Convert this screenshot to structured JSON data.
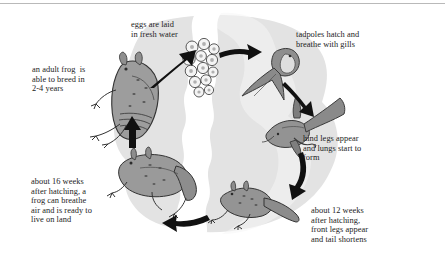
{
  "figure": {
    "background_color": "#ffffff",
    "blob_color": "#e3e3e3",
    "water_color": "#ffffff",
    "ink_color": "#1b1b1b",
    "rule_color": "#b9b9b9",
    "frog_fill": "#9a9a9a",
    "frog_shade": "#6d6d6d",
    "egg_fill": "#f2f2f2"
  },
  "labels": {
    "eggs": "eggs are laid\nin fresh water",
    "tadpoles": "tadpoles hatch and\nbreathe with gills",
    "adult": "an adult frog  is\nable to breed in\n2-4 years",
    "hind_legs": "hind legs appear\nand lungs start to\nform",
    "sixteen_weeks": "about 16 weeks\nafter hatching, a\nfrog can breathe\nair and is ready to\nlive on land",
    "twelve_weeks": "about 12 weeks\nafter hatching,\nfront legs appear\nand tail shortens"
  },
  "stages": [
    {
      "id": "eggs",
      "name": "frog eggs cluster",
      "caption": "eggs are laid in fresh water"
    },
    {
      "id": "tadpole",
      "name": "tadpole with gills",
      "caption": "tadpoles hatch and breathe with gills"
    },
    {
      "id": "tadpole-hind-legs",
      "name": "tadpole with hind legs",
      "caption": "hind legs appear and lungs start to form"
    },
    {
      "id": "froglet",
      "name": "froglet with front legs and shortening tail",
      "caption": "about 12 weeks after hatching, front legs appear and tail shortens"
    },
    {
      "id": "young-frog",
      "name": "young frog",
      "caption": "about 16 weeks after hatching, a frog can breathe air and is ready to live on land"
    },
    {
      "id": "adult-frog",
      "name": "adult frog",
      "caption": "an adult frog is able to breed in 2-4 years"
    }
  ],
  "arrows": [
    {
      "from": "adult-frog",
      "to": "eggs"
    },
    {
      "from": "eggs",
      "to": "tadpole"
    },
    {
      "from": "tadpole",
      "to": "tadpole-hind-legs"
    },
    {
      "from": "tadpole-hind-legs",
      "to": "froglet"
    },
    {
      "from": "froglet",
      "to": "young-frog"
    },
    {
      "from": "young-frog",
      "to": "adult-frog"
    }
  ]
}
